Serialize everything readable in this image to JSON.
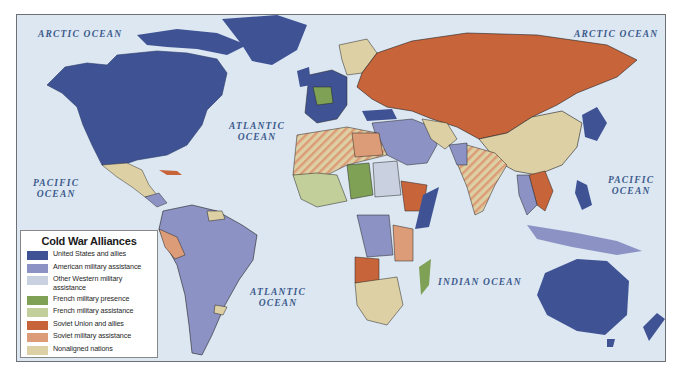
{
  "map": {
    "ocean_color": "#dce7f2",
    "ocean_labels": [
      {
        "id": "arctic-west",
        "text": "ARCTIC OCEAN",
        "x": 21,
        "y": 14
      },
      {
        "id": "arctic-east",
        "text": "ARCTIC OCEAN",
        "x": 557,
        "y": 14
      },
      {
        "id": "atlantic-north",
        "text": "ATLANTIC\nOCEAN",
        "x": 228,
        "y": 108
      },
      {
        "id": "atlantic-south",
        "text": "ATLANTIC\nOCEAN",
        "x": 249,
        "y": 274
      },
      {
        "id": "pacific-west",
        "text": "PACIFIC\nOCEAN",
        "x": 20,
        "y": 166
      },
      {
        "id": "pacific-east",
        "text": "PACIFIC\nOCEAN",
        "x": 605,
        "y": 163
      },
      {
        "id": "indian",
        "text": "INDIAN OCEAN",
        "x": 437,
        "y": 264
      }
    ]
  },
  "legend": {
    "title": "Cold War Alliances",
    "items": [
      {
        "label": "United States and allies",
        "color": "#3f5394"
      },
      {
        "label": "American military assistance",
        "color": "#8c93c4"
      },
      {
        "label": "Other Western military assistance",
        "color": "#c9d0e0"
      },
      {
        "label": "French military presence",
        "color": "#7fa155"
      },
      {
        "label": "French military assistance",
        "color": "#c2cf9a"
      },
      {
        "label": "Soviet Union and allies",
        "color": "#c8643a"
      },
      {
        "label": "Soviet military assistance",
        "color": "#dd9c78"
      },
      {
        "label": "Nonaligned nations",
        "color": "#ddd0a4"
      }
    ]
  }
}
